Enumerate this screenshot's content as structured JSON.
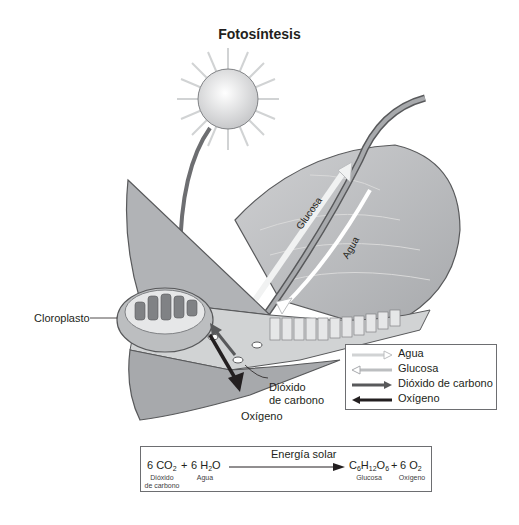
{
  "title": "Fotosíntesis",
  "labels": {
    "chloroplast": "Cloroplasto",
    "glucose_arrow": "Glucosa",
    "water_arrow": "Agua",
    "co2_label_line1": "Dióxido",
    "co2_label_line2": "de carbono",
    "oxygen_label": "Oxígeno"
  },
  "legend": {
    "items": [
      {
        "label": "Agua",
        "icon": "hollow-arrow-right",
        "color": "#d9d9d9"
      },
      {
        "label": "Glucosa",
        "icon": "hollow-arrow-left",
        "color": "#bfbfbf"
      },
      {
        "label": "Dióxido de carbono",
        "icon": "solid-arrow-right",
        "color": "#58595b"
      },
      {
        "label": "Oxígeno",
        "icon": "solid-arrow-left",
        "color": "#231f20"
      }
    ]
  },
  "equation": {
    "reactant1": "6 CO",
    "reactant1_sub": "2",
    "plus1": "+",
    "reactant2_pre": "6 H",
    "reactant2_sub": "2",
    "reactant2_post": "O",
    "arrow_label": "Energía solar",
    "product1_c": "C",
    "product1_c_sub": "6",
    "product1_h": "H",
    "product1_h_sub": "12",
    "product1_o": "O",
    "product1_o_sub": "6",
    "plus2": "+",
    "product2": "6 O",
    "product2_sub": "2",
    "reactant1_name_line1": "Dióxido",
    "reactant1_name_line2": "de carbono",
    "reactant2_name": "Agua",
    "product1_name": "Glucosa",
    "product2_name": "Oxígeno"
  },
  "colors": {
    "leaf_fill": "#bcbec0",
    "leaf_dark": "#939598",
    "outline": "#58595b",
    "sun_fill": "#e6e7e8",
    "arrow_dark": "#231f20"
  }
}
